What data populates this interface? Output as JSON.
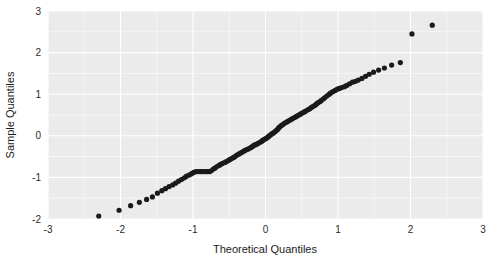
{
  "chart_data": {
    "type": "scatter",
    "title": "",
    "subtitle": "",
    "xlabel": "Theoretical Quantiles",
    "ylabel": "Sample Quantiles",
    "xlim": [
      -3,
      3
    ],
    "ylim": [
      -2,
      3
    ],
    "xticks": [
      -3,
      -2,
      -1,
      0,
      1,
      2,
      3
    ],
    "yticks": [
      -2,
      -1,
      0,
      1,
      2,
      3
    ],
    "xticklabels": [
      "-3",
      "-2",
      "-1",
      "0",
      "1",
      "2",
      "3"
    ],
    "yticklabels": [
      "-2",
      "-1",
      "0",
      "1",
      "2",
      "3"
    ],
    "grid": true,
    "grid_color": "#ffffff",
    "panel_background": "#ebebeb",
    "figure_background": "#ffffff",
    "legend": null,
    "legend_position": "none",
    "point_color": "#1a1a1a",
    "point_size": 2.6,
    "annotations": [],
    "series": [
      {
        "name": "Q-Q points",
        "x": [
          -2.3,
          -2.02,
          -1.86,
          -1.74,
          -1.64,
          -1.56,
          -1.49,
          -1.43,
          -1.38,
          -1.33,
          -1.28,
          -1.24,
          -1.2,
          -1.16,
          -1.12,
          -1.09,
          -1.05,
          -1.02,
          -0.99,
          -0.96,
          -0.93,
          -0.9,
          -0.88,
          -0.85,
          -0.82,
          -0.8,
          -0.77,
          -0.75,
          -0.72,
          -0.7,
          -0.68,
          -0.65,
          -0.63,
          -0.61,
          -0.59,
          -0.56,
          -0.54,
          -0.52,
          -0.5,
          -0.48,
          -0.46,
          -0.44,
          -0.42,
          -0.4,
          -0.38,
          -0.36,
          -0.34,
          -0.32,
          -0.3,
          -0.28,
          -0.26,
          -0.24,
          -0.22,
          -0.2,
          -0.18,
          -0.17,
          -0.15,
          -0.13,
          -0.11,
          -0.09,
          -0.07,
          -0.05,
          -0.04,
          -0.02,
          0.0,
          0.02,
          0.04,
          0.05,
          0.07,
          0.09,
          0.11,
          0.13,
          0.15,
          0.17,
          0.18,
          0.2,
          0.22,
          0.24,
          0.26,
          0.28,
          0.3,
          0.32,
          0.34,
          0.36,
          0.38,
          0.4,
          0.42,
          0.44,
          0.46,
          0.48,
          0.5,
          0.52,
          0.54,
          0.56,
          0.59,
          0.61,
          0.63,
          0.65,
          0.68,
          0.7,
          0.72,
          0.75,
          0.77,
          0.8,
          0.82,
          0.85,
          0.88,
          0.9,
          0.93,
          0.96,
          0.99,
          1.02,
          1.05,
          1.09,
          1.12,
          1.16,
          1.2,
          1.24,
          1.28,
          1.33,
          1.38,
          1.43,
          1.49,
          1.56,
          1.64,
          1.74,
          1.86,
          2.02,
          2.3
        ],
        "y": [
          -1.93,
          -1.79,
          -1.68,
          -1.6,
          -1.53,
          -1.47,
          -1.38,
          -1.32,
          -1.27,
          -1.22,
          -1.18,
          -1.14,
          -1.09,
          -1.05,
          -1.01,
          -0.97,
          -0.94,
          -0.91,
          -0.88,
          -0.86,
          -0.86,
          -0.86,
          -0.86,
          -0.86,
          -0.86,
          -0.86,
          -0.86,
          -0.84,
          -0.8,
          -0.78,
          -0.75,
          -0.72,
          -0.7,
          -0.68,
          -0.66,
          -0.64,
          -0.62,
          -0.6,
          -0.58,
          -0.56,
          -0.54,
          -0.52,
          -0.5,
          -0.47,
          -0.45,
          -0.43,
          -0.41,
          -0.39,
          -0.37,
          -0.35,
          -0.33,
          -0.32,
          -0.3,
          -0.28,
          -0.26,
          -0.24,
          -0.22,
          -0.21,
          -0.19,
          -0.17,
          -0.15,
          -0.13,
          -0.11,
          -0.09,
          -0.07,
          -0.05,
          -0.02,
          0.0,
          0.02,
          0.05,
          0.07,
          0.1,
          0.13,
          0.16,
          0.19,
          0.22,
          0.25,
          0.27,
          0.3,
          0.32,
          0.34,
          0.36,
          0.38,
          0.4,
          0.42,
          0.44,
          0.46,
          0.48,
          0.5,
          0.52,
          0.54,
          0.56,
          0.58,
          0.6,
          0.63,
          0.65,
          0.68,
          0.7,
          0.73,
          0.76,
          0.79,
          0.82,
          0.85,
          0.89,
          0.92,
          0.96,
          1.0,
          1.03,
          1.06,
          1.09,
          1.12,
          1.14,
          1.16,
          1.18,
          1.21,
          1.25,
          1.29,
          1.31,
          1.34,
          1.38,
          1.43,
          1.48,
          1.53,
          1.58,
          1.63,
          1.7,
          1.76,
          2.45,
          2.66
        ]
      }
    ]
  }
}
